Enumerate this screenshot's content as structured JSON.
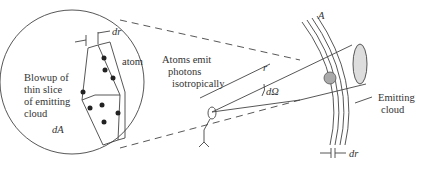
{
  "diagram": {
    "labels": {
      "blowup": [
        "Blowup of",
        "thin slice",
        "of emitting",
        "cloud"
      ],
      "atom": "atom",
      "dr_top": "dr",
      "dA": "dA",
      "atoms_emit": [
        "Atoms emit",
        "photons",
        "isotropically"
      ],
      "r": "r",
      "dOmega": "dΩ",
      "A": "A",
      "emitting_cloud": [
        "Emitting",
        "cloud"
      ],
      "dr_bottom": "dr"
    }
  }
}
